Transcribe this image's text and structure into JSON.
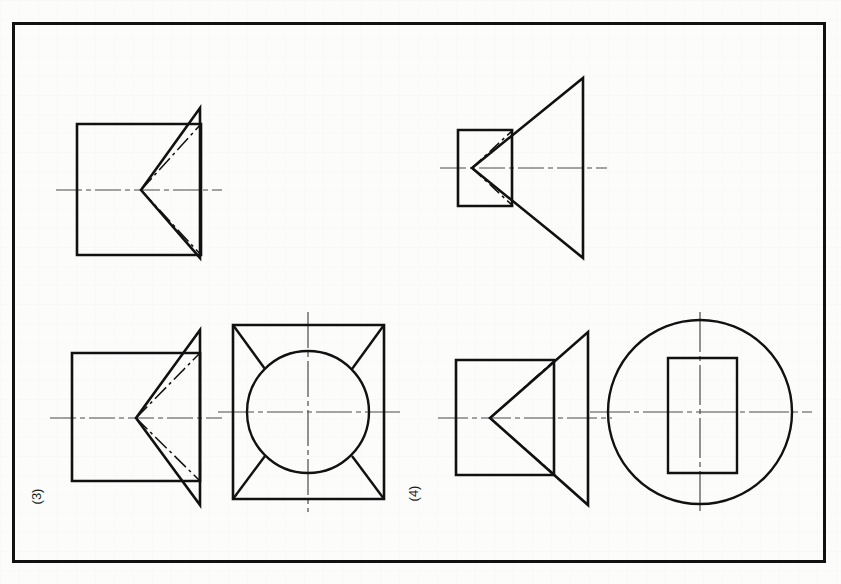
{
  "page": {
    "width": 841,
    "height": 584,
    "background_color": "#fcfcfb",
    "ink_color": "#111111",
    "centerline_color": "#555555"
  },
  "frame": {
    "name": "drawing-border",
    "x": 12,
    "y": 22,
    "width": 813,
    "height": 540,
    "stroke_width": 3,
    "color": "#111111"
  },
  "labels": [
    {
      "id": "label-3",
      "text": "(3)",
      "x": 38,
      "y": 497,
      "rotation_deg": -90
    },
    {
      "id": "label-4",
      "text": "(4)",
      "x": 415,
      "y": 494,
      "rotation_deg": -90
    }
  ],
  "figures": [
    {
      "id": "figure-3-front-view-top",
      "name": "cone-on-prism-front-view",
      "group": "3",
      "position": "top-left",
      "description": "Square prism front view with triangular cone silhouette projecting to the right and hidden dash-dot apex lines",
      "square": {
        "x": 77,
        "y": 124,
        "width": 124,
        "height": 131
      },
      "triangle": {
        "apex_x": 141,
        "apex_y": 190,
        "base_x": 200,
        "base_top_y": 108,
        "base_bottom_y": 258
      },
      "centerline": {
        "x1": 56,
        "x2": 222,
        "y": 190
      }
    },
    {
      "id": "figure-3-front-view-bottom",
      "name": "cone-on-prism-front-view-repeat",
      "group": "3",
      "position": "bottom-left",
      "description": "Same front view repeated in the lower row, paired with the circular top view",
      "square": {
        "x": 72,
        "y": 353,
        "width": 128,
        "height": 128
      },
      "triangle": {
        "apex_x": 136,
        "apex_y": 418,
        "base_x": 200,
        "base_top_y": 330,
        "base_bottom_y": 505
      },
      "centerline": {
        "x1": 50,
        "x2": 222,
        "y": 418
      }
    },
    {
      "id": "figure-3-top-view",
      "name": "square-with-inscribed-circle-top-view",
      "group": "3",
      "position": "bottom-center",
      "description": "Square outline with inscribed circle and four corner diagonals meeting the circle tangentially",
      "square": {
        "x": 233,
        "y": 325,
        "width": 151,
        "height": 174
      },
      "circle": {
        "cx": 308,
        "cy": 412,
        "r": 61
      },
      "centerline_h": {
        "x1": 218,
        "x2": 400,
        "y": 412
      },
      "centerline_v": {
        "y1": 312,
        "y2": 512,
        "x": 308
      }
    },
    {
      "id": "figure-4-front-view-top",
      "name": "flared-cone-front-view",
      "group": "4",
      "position": "top-right",
      "description": "Small square prism at left with a large flared triangle opening to the right; dash-dot lines mark the hidden apex",
      "square": {
        "x": 458,
        "y": 130,
        "width": 54,
        "height": 76
      },
      "triangle": {
        "apex_x": 472,
        "apex_y": 168,
        "base_x": 583,
        "base_top_y": 78,
        "base_bottom_y": 258
      },
      "centerline": {
        "x1": 440,
        "x2": 605,
        "y": 168
      }
    },
    {
      "id": "figure-4-front-view-bottom",
      "name": "flared-cone-front-view-repeat",
      "group": "4",
      "position": "bottom-right-left",
      "description": "Front view repeated in lower row paired with the circular top view",
      "square": {
        "x": 456,
        "y": 360,
        "width": 98,
        "height": 115
      },
      "triangle": {
        "apex_x": 490,
        "apex_y": 418,
        "base_x": 588,
        "base_top_y": 332,
        "base_bottom_y": 505
      },
      "centerline": {
        "x1": 438,
        "x2": 610,
        "y": 418
      }
    },
    {
      "id": "figure-4-top-view",
      "name": "circle-with-inner-rectangle-top-view",
      "group": "4",
      "position": "bottom-far-right",
      "description": "Large circle with a vertical rectangle centred inside it",
      "circle": {
        "cx": 700,
        "cy": 412,
        "r": 92
      },
      "rectangle": {
        "x": 668,
        "y": 358,
        "width": 69,
        "height": 115
      },
      "centerline_h": {
        "x1": 590,
        "x2": 812,
        "y": 412
      },
      "centerline_v": {
        "y1": 312,
        "y2": 512,
        "x": 700
      }
    }
  ],
  "line_styles": {
    "visible_edge": {
      "name": "continuous-thick",
      "width": 2.6
    },
    "hidden_axis": {
      "name": "dash-dot-thin",
      "width": 1.4,
      "dash_pattern": "14 4 3 4"
    },
    "centre_line": {
      "name": "centre-dash-dot",
      "width": 1.1,
      "dash_pattern": "22 4 4 4"
    }
  }
}
